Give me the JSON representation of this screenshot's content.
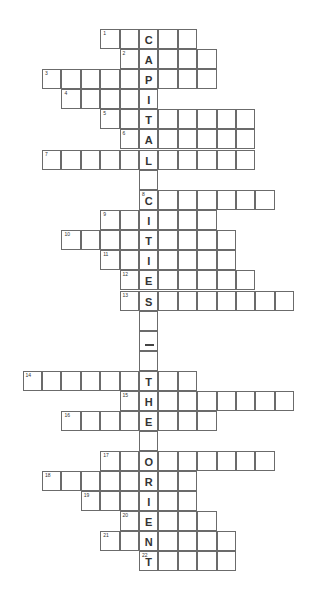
{
  "puzzle": {
    "theme_vertical": "CAPITAL CITIES — THE ORIENT",
    "cols_origin_x": 42,
    "col_width": 19.4,
    "row_height": 19.6,
    "rows": [
      {
        "num": "1",
        "y": 29,
        "start": 3,
        "end": 7,
        "key": "C"
      },
      {
        "num": "2",
        "y": 49,
        "start": 4,
        "end": 8,
        "key": "A"
      },
      {
        "num": "3",
        "y": 69,
        "start": 0,
        "end": 8,
        "key": "P"
      },
      {
        "num": "4",
        "y": 89,
        "start": 1,
        "end": 5,
        "key": "I"
      },
      {
        "num": "5",
        "y": 109,
        "start": 3,
        "end": 10,
        "key": "T"
      },
      {
        "num": "6",
        "y": 129,
        "start": 4,
        "end": 10,
        "key": "A"
      },
      {
        "num": "7",
        "y": 150,
        "start": 0,
        "end": 10,
        "key": "L"
      },
      {
        "num": "",
        "y": 170,
        "start": 5,
        "end": 5,
        "key": ""
      },
      {
        "num": "8",
        "y": 190,
        "start": 5,
        "end": 11,
        "key": "C"
      },
      {
        "num": "9",
        "y": 210,
        "start": 3,
        "end": 8,
        "key": "I"
      },
      {
        "num": "10",
        "y": 230,
        "start": 1,
        "end": 9,
        "key": "T"
      },
      {
        "num": "11",
        "y": 250,
        "start": 3,
        "end": 9,
        "key": "I"
      },
      {
        "num": "12",
        "y": 270,
        "start": 4,
        "end": 10,
        "key": "E"
      },
      {
        "num": "13",
        "y": 291,
        "start": 4,
        "end": 12,
        "key": "S"
      },
      {
        "num": "",
        "y": 311,
        "start": 5,
        "end": 5,
        "key": ""
      },
      {
        "num": "",
        "y": 331,
        "start": 5,
        "end": 5,
        "key": "—"
      },
      {
        "num": "",
        "y": 351,
        "start": 5,
        "end": 5,
        "key": ""
      },
      {
        "num": "14",
        "y": 371,
        "start": -1,
        "end": 7,
        "key": "T"
      },
      {
        "num": "15",
        "y": 391,
        "start": 4,
        "end": 12,
        "key": "H"
      },
      {
        "num": "16",
        "y": 411,
        "start": 1,
        "end": 8,
        "key": "E"
      },
      {
        "num": "",
        "y": 431,
        "start": 5,
        "end": 5,
        "key": ""
      },
      {
        "num": "17",
        "y": 451,
        "start": 3,
        "end": 11,
        "key": "O"
      },
      {
        "num": "18",
        "y": 471,
        "start": 0,
        "end": 7,
        "key": "R"
      },
      {
        "num": "19",
        "y": 491,
        "start": 2,
        "end": 7,
        "key": "I"
      },
      {
        "num": "20",
        "y": 511,
        "start": 4,
        "end": 8,
        "key": "E"
      },
      {
        "num": "21",
        "y": 531,
        "start": 3,
        "end": 9,
        "key": "N"
      },
      {
        "num": "22",
        "y": 551,
        "start": 5,
        "end": 9,
        "key": "T"
      }
    ],
    "key_column": 5
  }
}
